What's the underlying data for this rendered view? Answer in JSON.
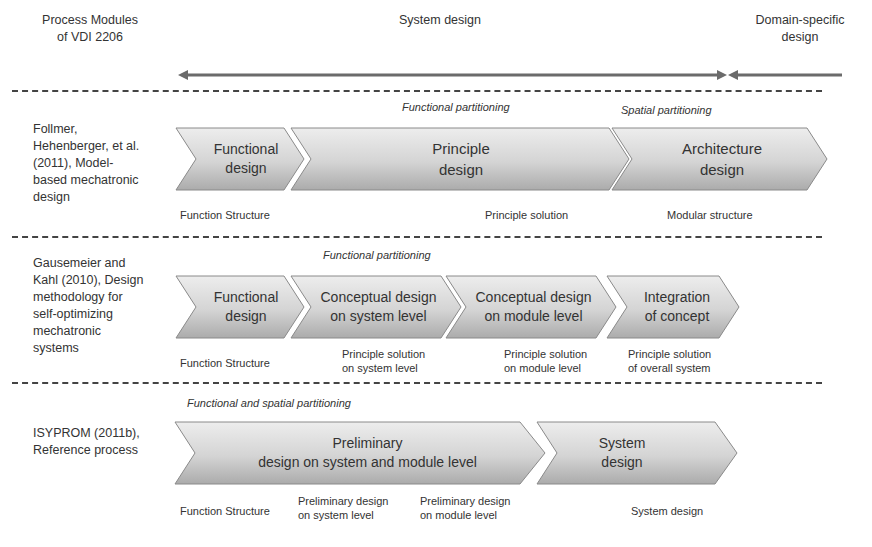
{
  "header": {
    "row_label": "Process Modules\nof VDI 2206",
    "system_design": "System design",
    "domain_specific": "Domain-specific\ndesign"
  },
  "rows": [
    {
      "label": "Follmer,\nHehenberger, et al.\n(2011), Model-\nbased mechatronic\ndesign",
      "annotations": [
        "Functional partitioning",
        "Spatial partitioning"
      ],
      "steps": [
        "Functional\ndesign",
        "Principle\ndesign",
        "Architecture\ndesign"
      ],
      "outputs": [
        "Function Structure",
        "Principle solution",
        "Modular structure"
      ]
    },
    {
      "label": "Gausemeier and\nKahl (2010), Design\nmethodology for\nself-optimizing\nmechatronic\nsystems",
      "annotations": [
        "Functional partitioning"
      ],
      "steps": [
        "Functional\ndesign",
        "Conceptual design\non system level",
        "Conceptual design\non module level",
        "Integration\nof concept"
      ],
      "outputs": [
        "Function Structure",
        "Principle solution\non system level",
        "Principle solution\non module level",
        "Principle solution\nof overall system"
      ]
    },
    {
      "label": "ISYPROM (2011b),\nReference process",
      "annotations": [
        "Functional and spatial partitioning"
      ],
      "steps": [
        "Preliminary\ndesign on system and module level",
        "System\ndesign"
      ],
      "outputs": [
        "Function Structure",
        "Preliminary design\non system level",
        "Preliminary design\non module level",
        "System design"
      ]
    }
  ],
  "colors": {
    "chevron_fill_light": "#e6e6e6",
    "chevron_fill_dark": "#b5b5b5",
    "chevron_stroke": "#8a8a8a",
    "arrow": "#6b6b6b",
    "text": "#333333"
  }
}
